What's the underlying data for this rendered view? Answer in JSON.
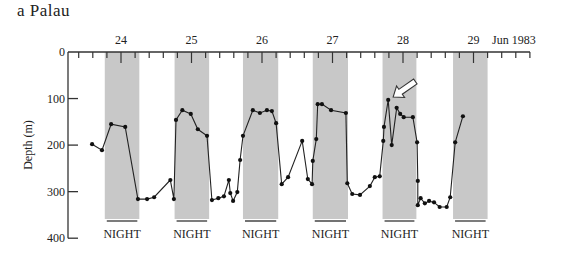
{
  "title": "a  Palau",
  "chart_data": {
    "type": "line",
    "title": "a  Palau",
    "xlabel": "Jun 1983",
    "ylabel": "Depth (m)",
    "ylim": [
      400,
      0
    ],
    "xlim": [
      23.3,
      29.8
    ],
    "y_ticks": [
      0,
      100,
      200,
      300,
      400
    ],
    "x_major_ticks": [
      24,
      25,
      26,
      27,
      28,
      29
    ],
    "x_minor_interval": 0.2,
    "x_tick_labels": [
      "24",
      "25",
      "26",
      "27",
      "28",
      "29"
    ],
    "x_unit_label": "Jun 1983",
    "grid": false,
    "legend": null,
    "night_bands": [
      {
        "start": 23.77,
        "end": 24.26,
        "label": "NIGHT"
      },
      {
        "start": 24.76,
        "end": 25.25,
        "label": "NIGHT"
      },
      {
        "start": 25.73,
        "end": 26.23,
        "label": "NIGHT"
      },
      {
        "start": 26.72,
        "end": 27.22,
        "label": "NIGHT"
      },
      {
        "start": 27.71,
        "end": 28.19,
        "label": "NIGHT"
      },
      {
        "start": 28.71,
        "end": 29.2,
        "label": "NIGHT"
      }
    ],
    "annotations": [
      {
        "type": "arrow",
        "style": "hollow-white",
        "points_to": {
          "x": 27.79,
          "y": 103
        },
        "description": "arrow pointing to shallow excursion on 28 Jun"
      }
    ],
    "series": [
      {
        "name": "Depth",
        "marker": "circle",
        "x": [
          23.59,
          23.73,
          23.86,
          24.06,
          24.24,
          24.37,
          24.47,
          24.7,
          24.75,
          24.78,
          24.87,
          24.99,
          25.09,
          25.22,
          25.29,
          25.38,
          25.46,
          25.53,
          25.55,
          25.59,
          25.65,
          25.69,
          25.73,
          25.87,
          25.97,
          26.07,
          26.14,
          26.2,
          26.28,
          26.37,
          26.57,
          26.65,
          26.71,
          26.72,
          26.77,
          26.79,
          26.85,
          26.98,
          27.19,
          27.21,
          27.28,
          27.39,
          27.53,
          27.6,
          27.67,
          27.72,
          27.73,
          27.79,
          27.84,
          27.91,
          27.96,
          28.01,
          28.14,
          28.2,
          28.21,
          28.21,
          28.25,
          28.31,
          28.37,
          28.44,
          28.52,
          28.62,
          28.67,
          28.74,
          28.85
        ],
        "y": [
          198,
          211,
          155,
          161,
          316,
          316,
          312,
          275,
          316,
          146,
          125,
          133,
          166,
          180,
          318,
          314,
          310,
          275,
          303,
          320,
          301,
          232,
          180,
          125,
          131,
          125,
          127,
          153,
          284,
          269,
          191,
          273,
          284,
          234,
          187,
          112,
          112,
          125,
          131,
          282,
          305,
          307,
          288,
          269,
          267,
          191,
          161,
          103,
          200,
          120,
          133,
          140,
          140,
          194,
          277,
          329,
          314,
          325,
          320,
          323,
          333,
          333,
          312,
          194,
          138
        ]
      }
    ]
  }
}
